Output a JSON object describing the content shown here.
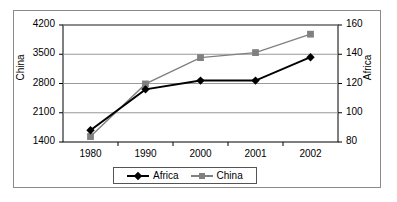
{
  "chart_data": {
    "type": "line",
    "title": "",
    "xlabel": "",
    "categories": [
      "1980",
      "1990",
      "2000",
      "2001",
      "2002"
    ],
    "grid": true,
    "legend_position": "bottom",
    "axes": {
      "left": {
        "label": "China",
        "ticks": [
          "1400",
          "2100",
          "2800",
          "3500",
          "4200"
        ],
        "ylim": [
          1400,
          4200
        ],
        "series": "China"
      },
      "right": {
        "label": "Africa",
        "ticks": [
          "80",
          "100",
          "120",
          "140",
          "160"
        ],
        "ylim": [
          80,
          160
        ],
        "series": "Africa"
      }
    },
    "series": [
      {
        "name": "Africa",
        "axis": "right",
        "color": "#000000",
        "marker": "diamond",
        "values": [
          88,
          116,
          122,
          122,
          138
        ]
      },
      {
        "name": "China",
        "axis": "left",
        "color": "#808080",
        "marker": "square",
        "values": [
          1530,
          2790,
          3420,
          3540,
          3980
        ]
      }
    ]
  },
  "legend": {
    "items": [
      {
        "label": "Africa",
        "marker": "diamond-marker-icon",
        "color": "#000000"
      },
      {
        "label": "China",
        "marker": "square-marker-icon",
        "color": "#808080"
      }
    ]
  },
  "colors": {
    "africa": "#000000",
    "china": "#808080",
    "grid": "#999999",
    "axis": "#000000",
    "frame": "#8a8a8a",
    "background": "#ffffff"
  }
}
